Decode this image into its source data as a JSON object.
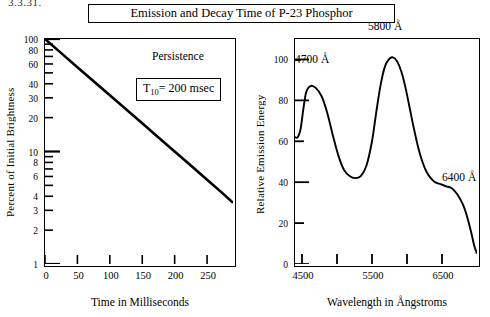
{
  "corner_note": "3.3.31.",
  "title": "Emission and Decay Time of P-23 Phosphor",
  "chart_data": [
    {
      "type": "line",
      "title": "Persistence",
      "xlabel": "Time in Milliseconds",
      "ylabel": "Percent of Initial Brightness",
      "yscale": "log",
      "xlim": [
        0,
        290
      ],
      "ylim": [
        1,
        100
      ],
      "xticks": [
        0,
        50,
        100,
        150,
        200,
        250
      ],
      "xtick_labels": [
        "0",
        "50",
        "100",
        "150",
        "200",
        "250"
      ],
      "yticks": [
        100,
        80,
        60,
        40,
        30,
        20,
        10,
        8,
        6,
        4,
        3,
        2,
        1
      ],
      "ytick_labels": [
        "100",
        "80",
        "60",
        "40",
        "30",
        "20",
        "10",
        "8",
        "6",
        "4",
        "3",
        "2",
        "1"
      ],
      "grid": false,
      "annotation_persistence": "Persistence",
      "annotation_t10_prefix": "T",
      "annotation_t10_sub": "10",
      "annotation_t10_suffix": "= 200 msec",
      "series": [
        {
          "name": "Decay",
          "x": [
            0,
            25,
            50,
            75,
            100,
            125,
            150,
            175,
            200,
            225,
            250,
            275,
            290
          ],
          "values": [
            100,
            74.9,
            56.2,
            42.2,
            31.6,
            23.7,
            17.8,
            13.3,
            10.0,
            7.5,
            5.6,
            4.2,
            3.5
          ]
        }
      ]
    },
    {
      "type": "line",
      "title": "",
      "xlabel": "Wavelength in Ångstroms",
      "ylabel": "Relative Emission Energy",
      "yscale": "linear",
      "xlim": [
        4400,
        7000
      ],
      "ylim": [
        0,
        110
      ],
      "xticks": [
        4500,
        5000,
        5500,
        6000,
        6500
      ],
      "xtick_major": [
        4500,
        5500,
        6500
      ],
      "xtick_labels": [
        "4500",
        "5500",
        "6500"
      ],
      "yticks": [
        0,
        20,
        40,
        60,
        80,
        100
      ],
      "ytick_labels": [
        "0",
        "20",
        "40",
        "60",
        "80",
        "100"
      ],
      "grid": false,
      "annotations": [
        {
          "label": "4700 Å",
          "x": 4700,
          "y": 87
        },
        {
          "label": "5800 Å",
          "x": 5800,
          "y": 101
        },
        {
          "label": "6400 Å",
          "x": 6400,
          "y": 40
        }
      ],
      "series": [
        {
          "name": "Emission spectrum",
          "x": [
            4400,
            4440,
            4480,
            4520,
            4560,
            4620,
            4700,
            4780,
            4860,
            4940,
            5020,
            5100,
            5180,
            5260,
            5340,
            5420,
            5500,
            5560,
            5620,
            5680,
            5740,
            5800,
            5860,
            5920,
            5980,
            6040,
            6100,
            6160,
            6220,
            6280,
            6340,
            6400,
            6480,
            6560,
            6640,
            6720,
            6800,
            6860,
            6920,
            6960,
            7000
          ],
          "values": [
            62,
            62,
            66,
            76,
            84,
            87,
            86,
            82,
            74,
            63,
            53,
            46,
            43,
            42,
            43,
            48,
            60,
            74,
            87,
            96,
            100,
            101,
            99,
            94,
            86,
            76,
            66,
            57,
            50,
            45,
            42,
            40,
            39,
            38,
            37,
            34,
            29,
            23,
            15,
            9,
            5
          ]
        }
      ]
    }
  ]
}
